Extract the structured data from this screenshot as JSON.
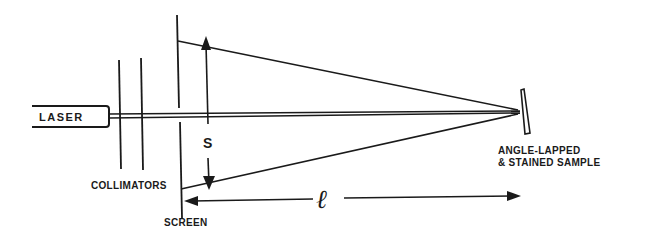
{
  "diagram": {
    "type": "optical-setup-schematic",
    "labels": {
      "laser": "LASER",
      "collimators": "COLLIMATORS",
      "screen": "SCREEN",
      "sample_line1": "ANGLE-LAPPED",
      "sample_line2": "& STAINED SAMPLE",
      "spacing": "S",
      "distance": "ℓ"
    },
    "components": [
      {
        "id": "laser",
        "label": "LASER"
      },
      {
        "id": "collimators",
        "label": "COLLIMATORS",
        "count": 2
      },
      {
        "id": "screen",
        "label": "SCREEN"
      },
      {
        "id": "sample",
        "label": "ANGLE-LAPPED & STAINED SAMPLE"
      }
    ],
    "dimensions": [
      {
        "id": "S",
        "meaning": "separation of reflected spots on screen",
        "direction": "vertical",
        "arrows": "both"
      },
      {
        "id": "l",
        "meaning": "screen-to-sample distance",
        "direction": "horizontal",
        "arrows": "both"
      }
    ],
    "colors": {
      "ink": "#1a1a1a",
      "background": "#ffffff"
    }
  }
}
